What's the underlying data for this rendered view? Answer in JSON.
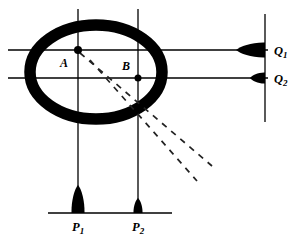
{
  "figure": {
    "background_color": "#ffffff",
    "ink_color": "#000000"
  },
  "ring": {
    "name": "annulus",
    "center_x": 96,
    "center_y": 72,
    "radius_x": 66,
    "radius_y": 47,
    "stroke_width": 11.5,
    "color": "#000000"
  },
  "points": [
    {
      "id": "A",
      "label": "A",
      "x": 78,
      "y": 50,
      "label_x": 64,
      "label_y": 67,
      "dot_radius": 4
    },
    {
      "id": "B",
      "label": "B",
      "x": 138,
      "y": 78,
      "label_x": 126,
      "label_y": 70,
      "dot_radius": 3.5
    }
  ],
  "grid_lines": {
    "verticals": [
      {
        "name": "vertical-line-through-a",
        "x": 78,
        "y1": 9,
        "y2": 201
      },
      {
        "name": "vertical-line-through-b",
        "x": 138,
        "y1": 9,
        "y2": 201
      }
    ],
    "horizontals": [
      {
        "name": "horizontal-line-q1",
        "y": 50,
        "x1": 8,
        "x2": 268
      },
      {
        "name": "horizontal-line-q2",
        "y": 78,
        "x1": 8,
        "x2": 268
      }
    ]
  },
  "detector_axes": {
    "vertical_detector": {
      "name": "q-detector-axis",
      "x": 265,
      "y1": 14,
      "y2": 122
    },
    "horizontal_detector": {
      "name": "p-detector-axis",
      "y": 213,
      "x1": 48,
      "x2": 172
    }
  },
  "peaks": {
    "q_peaks": [
      {
        "id": "Q1",
        "label": "Q",
        "subscript": "1",
        "axis_y": 50,
        "amplitude": 29,
        "half_width": 7.5,
        "label_x": 274,
        "label_y": 55
      },
      {
        "id": "Q2",
        "label": "Q",
        "subscript": "2",
        "axis_y": 78,
        "amplitude": 15,
        "half_width": 5.5,
        "label_x": 274,
        "label_y": 83
      }
    ],
    "p_peaks": [
      {
        "id": "P1",
        "label": "P",
        "subscript": "1",
        "axis_x": 78,
        "amplitude": 28,
        "half_width": 6.5,
        "label_x": 72,
        "label_y": 231
      },
      {
        "id": "P2",
        "label": "P",
        "subscript": "2",
        "axis_x": 138,
        "amplitude": 15,
        "half_width": 4.5,
        "label_x": 132,
        "label_y": 231
      }
    ]
  },
  "dashed_rays": [
    {
      "name": "ray-from-a",
      "x1": 80,
      "y1": 53,
      "x2": 212,
      "y2": 166,
      "dash": "6 6"
    },
    {
      "name": "ray-from-b",
      "x1": 90,
      "y1": 60,
      "x2": 197,
      "y2": 181,
      "dash": "6 6"
    }
  ]
}
